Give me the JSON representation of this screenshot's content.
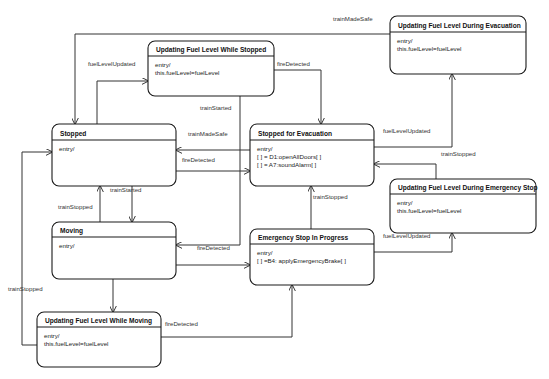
{
  "diagram": {
    "type": "uml-state-machine",
    "title": "",
    "background_color": "#ffffff",
    "line_color": "#333333",
    "text_color": "#222222",
    "states": [
      {
        "id": "updating_fuel_level_while_stopped",
        "name": "Updating Fuel Level While Stopped",
        "body": [
          "entry/",
          "this.fuelLevel=fuelLevel"
        ],
        "x": 148,
        "y": 41,
        "w": 126,
        "h": 55,
        "header_h": 15
      },
      {
        "id": "updating_fuel_level_during_evacuation",
        "name": "Updating Fuel Level During Evacuation",
        "body": [
          "entry/",
          "this.fuelLevel=fuelLevel"
        ],
        "x": 390,
        "y": 16,
        "w": 136,
        "h": 58,
        "header_h": 16
      },
      {
        "id": "stopped",
        "name": "Stopped",
        "body": [
          "entry/"
        ],
        "x": 52,
        "y": 124,
        "w": 124,
        "h": 62,
        "header_h": 16
      },
      {
        "id": "stopped_for_evacuation",
        "name": "Stopped for Evacuation",
        "body": [
          "entry/",
          "[ ] = D1:openAllDoors[ ]",
          "[ ] = A7:soundAlarm[ ]"
        ],
        "x": 250,
        "y": 124,
        "w": 124,
        "h": 62,
        "header_h": 16
      },
      {
        "id": "updating_fuel_level_during_emergency_stop",
        "name": "Updating Fuel Level During Emergency Stop",
        "body": [
          "entry/",
          "this.fuelLevel=fuelLevel"
        ],
        "x": 390,
        "y": 179,
        "w": 146,
        "h": 54,
        "header_h": 15
      },
      {
        "id": "moving",
        "name": "Moving",
        "body": [
          "entry/"
        ],
        "x": 52,
        "y": 222,
        "w": 124,
        "h": 57,
        "header_h": 15
      },
      {
        "id": "emergency_stop_in_progress",
        "name": "Emergency Stop In Progress",
        "body": [
          "entry/",
          "[ ] =B4: applyEmergencyBrake[ ]"
        ],
        "x": 250,
        "y": 229,
        "w": 124,
        "h": 56,
        "header_h": 15
      },
      {
        "id": "updating_fuel_level_while_moving",
        "name": "Updating Fuel Level While Moving",
        "body": [
          "entry/",
          "this.fuelLevel=fuelLevel"
        ],
        "x": 37,
        "y": 312,
        "w": 124,
        "h": 55,
        "header_h": 15
      }
    ],
    "transitions": [
      {
        "id": "t1",
        "from": "updating_fuel_level_during_evacuation",
        "to": "stopped",
        "label": "trainMadeSafe",
        "label_x": 333,
        "label_y": 21,
        "path": "M 390 34 L 75 34 L 75 124",
        "arrow": "down",
        "arrow_x": 75,
        "arrow_y": 124
      },
      {
        "id": "t2",
        "from": "stopped",
        "to": "updating_fuel_level_while_stopped",
        "label": "fuelLevelUpdated",
        "label_x": 88,
        "label_y": 66,
        "path": "M 97 124 L 97 81 L 148 81",
        "arrow": "right",
        "arrow_x": 148,
        "arrow_y": 81
      },
      {
        "id": "t3",
        "from": "updating_fuel_level_while_stopped",
        "to": "stopped_for_evacuation",
        "label": "fireDetected",
        "label_x": 277,
        "label_y": 66,
        "path": "M 274 70 L 321 70 L 321 124",
        "arrow": "down",
        "arrow_x": 321,
        "arrow_y": 124
      },
      {
        "id": "t4",
        "from": "updating_fuel_level_while_stopped",
        "to": "moving",
        "label": "trainStarted",
        "label_x": 200,
        "label_y": 110,
        "path": "M 240 96 L 240 245 L 176 245",
        "arrow": "left",
        "arrow_x": 176,
        "arrow_y": 245
      },
      {
        "id": "t5",
        "from": "stopped_for_evacuation",
        "to": "stopped",
        "label": "trainMadeSafe",
        "label_x": 188,
        "label_y": 136,
        "path": "M 250 150 L 176 150",
        "arrow": "left",
        "arrow_x": 176,
        "arrow_y": 150
      },
      {
        "id": "t6",
        "from": "stopped",
        "to": "stopped_for_evacuation",
        "label": "fireDetected",
        "label_x": 182,
        "label_y": 162,
        "path": "M 176 171 L 250 171",
        "arrow": "right",
        "arrow_x": 250,
        "arrow_y": 171
      },
      {
        "id": "t7",
        "from": "stopped_for_evacuation",
        "to": "updating_fuel_level_during_evacuation",
        "label": "fuelLevelUpdated",
        "label_x": 383,
        "label_y": 133,
        "path": "M 374 147 L 452 147 L 452 74",
        "arrow": "up",
        "arrow_x": 452,
        "arrow_y": 74
      },
      {
        "id": "t8",
        "from": "updating_fuel_level_during_emergency_stop",
        "to": "stopped_for_evacuation",
        "label": "trainStopped",
        "label_x": 441,
        "label_y": 156,
        "path": "M 436 179 L 436 164 L 374 164",
        "arrow": "left",
        "arrow_x": 374,
        "arrow_y": 164
      },
      {
        "id": "t9",
        "from": "stopped",
        "to": "moving",
        "label": "trainStarted",
        "label_x": 110,
        "label_y": 192,
        "path": "M 132 186 L 132 222",
        "arrow": "down",
        "arrow_x": 132,
        "arrow_y": 222
      },
      {
        "id": "t10",
        "from": "moving",
        "to": "stopped",
        "label": "trainStopped",
        "label_x": 58,
        "label_y": 209,
        "path": "M 100 222 L 100 186",
        "arrow": "up",
        "arrow_x": 100,
        "arrow_y": 186
      },
      {
        "id": "t11",
        "from": "moving",
        "to": "emergency_stop_in_progress",
        "label": "fireDetected",
        "label_x": 197,
        "label_y": 250,
        "path": "M 176 265 L 250 265",
        "arrow": "right",
        "arrow_x": 250,
        "arrow_y": 265
      },
      {
        "id": "t12",
        "from": "emergency_stop_in_progress",
        "to": "stopped_for_evacuation",
        "label": "trainStopped",
        "label_x": 313,
        "label_y": 199,
        "path": "M 311 229 L 311 186",
        "arrow": "up",
        "arrow_x": 311,
        "arrow_y": 186
      },
      {
        "id": "t13",
        "from": "emergency_stop_in_progress",
        "to": "updating_fuel_level_during_emergency_stop",
        "label": "fuelLevelUpdated",
        "label_x": 383,
        "label_y": 238,
        "path": "M 374 252 L 452 252 L 452 233",
        "arrow": "up",
        "arrow_x": 452,
        "arrow_y": 233
      },
      {
        "id": "t14",
        "from": "moving",
        "to": "updating_fuel_level_while_moving",
        "label": "fuelLevelUpdated",
        "label_x": 116,
        "label_y": 276,
        "path": "M 113 279 L 113 312",
        "arrow": "down",
        "arrow_x": 113,
        "arrow_y": 312
      },
      {
        "id": "t15",
        "from": "updating_fuel_level_while_moving",
        "to": "emergency_stop_in_progress",
        "label": "fireDetected",
        "label_x": 165,
        "label_y": 326,
        "path": "M 161 337 L 292 337 L 292 285",
        "arrow": "up",
        "arrow_x": 292,
        "arrow_y": 285
      },
      {
        "id": "t16",
        "from": "updating_fuel_level_while_moving",
        "to": "stopped",
        "label": "trainStopped",
        "label_x": 8,
        "label_y": 291,
        "path": "M 37 345 L 22 345 L 22 152 L 52 152",
        "arrow": "right",
        "arrow_x": 52,
        "arrow_y": 152
      }
    ]
  }
}
